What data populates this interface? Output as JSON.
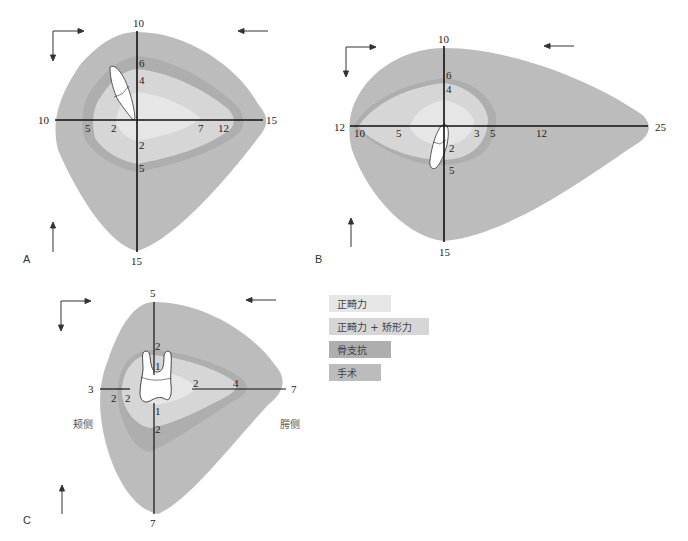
{
  "colors": {
    "orthodontic": "#e6e6e6",
    "orthodontic_growth": "#d6d6d6",
    "skeletal_anchorage": "#aeaeae",
    "surgery": "#bcbcbc",
    "axis": "#111111"
  },
  "panels": {
    "A": {
      "letter": "A",
      "axis_labels": {
        "top": "10",
        "bottom": "15",
        "left": "10",
        "right": "15"
      },
      "inner_labels": {
        "up_6": "6",
        "up_4": "4",
        "left_5": "5",
        "left_2": "2",
        "right_7": "7",
        "right_12": "12",
        "down_2": "2",
        "down_5": "5"
      }
    },
    "B": {
      "letter": "B",
      "axis_labels": {
        "top": "10",
        "bottom": "15",
        "left": "12",
        "right": "25"
      },
      "inner_labels": {
        "up_6": "6",
        "up_4": "4",
        "left_10": "10",
        "left_5": "5",
        "right_3": "3",
        "right_5": "5",
        "right_12": "12",
        "down_2": "2",
        "down_5": "5"
      }
    },
    "C": {
      "letter": "C",
      "axis_labels": {
        "top": "5",
        "bottom": "7",
        "left": "3",
        "right": "7"
      },
      "inner_labels": {
        "up_2": "2",
        "up_1": "1",
        "left_2a": "2",
        "left_2b": "2",
        "right_2": "2",
        "right_4": "4",
        "down_1": "1",
        "down_2": "2"
      },
      "side_labels": {
        "buccal": "颊侧",
        "palatal": "腭侧"
      }
    }
  },
  "legend": {
    "items": [
      {
        "label": "正畸力",
        "color": "#e6e6e6",
        "width": 62
      },
      {
        "label": "正畸力 + 矫形力",
        "color": "#d6d6d6",
        "width": 100
      },
      {
        "label": "骨支抗",
        "color": "#aeaeae",
        "width": 62
      },
      {
        "label": "手术",
        "color": "#bcbcbc",
        "width": 52
      }
    ]
  }
}
